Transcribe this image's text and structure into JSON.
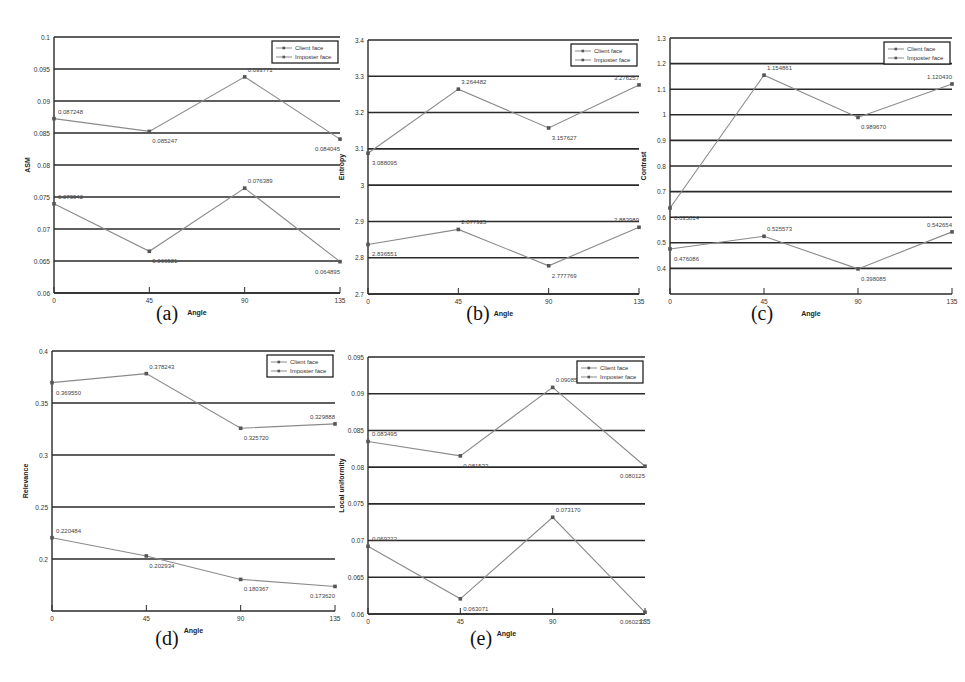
{
  "figure": {
    "captions": [
      "(a)",
      "(b)",
      "(c)",
      "(d)",
      "(e)"
    ]
  },
  "legend": {
    "entries": [
      "Client face",
      "Imposter face"
    ]
  },
  "chart_data": [
    {
      "id": "a",
      "type": "line",
      "caption": "(a)",
      "xlabel": "Angle",
      "ylabel": "ASM",
      "x": [
        0,
        45,
        90,
        135
      ],
      "xticks": [
        "0",
        "45",
        "90",
        "135"
      ],
      "ylim": [
        0.06,
        0.1
      ],
      "yticks": [
        "0.06",
        "0.065",
        "0.07",
        "0.075",
        "0.08",
        "0.085",
        "0.09",
        "0.095",
        "0.1"
      ],
      "grid": true,
      "legend_position": "top-right",
      "series": [
        {
          "name": "Client face",
          "values": [
            0.087248,
            0.085247,
            0.093771,
            0.084045
          ],
          "labels": [
            "0.087248",
            "0.085247",
            "0.093771",
            "0.084045"
          ]
        },
        {
          "name": "Imposter face",
          "values": [
            0.073942,
            0.066521,
            0.076389,
            0.064895
          ],
          "labels": [
            "0.073942",
            "0.066521",
            "0.076389",
            "0.064895"
          ]
        }
      ]
    },
    {
      "id": "b",
      "type": "line",
      "caption": "(b)",
      "xlabel": "Angle",
      "ylabel": "Entropy",
      "x": [
        0,
        45,
        90,
        135
      ],
      "xticks": [
        "0",
        "45",
        "90",
        "135"
      ],
      "ylim": [
        2.7,
        3.4
      ],
      "yticks": [
        "2.7",
        "2.8",
        "2.9",
        "3",
        "3.1",
        "3.2",
        "3.3",
        "3.4"
      ],
      "grid": true,
      "legend_position": "top-right",
      "series": [
        {
          "name": "Client face",
          "values": [
            3.088095,
            3.264482,
            3.157627,
            3.276257
          ],
          "labels": [
            "3.088095",
            "3.264482",
            "3.157627",
            "3.276257"
          ]
        },
        {
          "name": "Imposter face",
          "values": [
            2.836551,
            2.877925,
            2.777769,
            2.883989
          ],
          "labels": [
            "2.836551",
            "2.877925",
            "2.777769",
            "2.883989"
          ]
        }
      ]
    },
    {
      "id": "c",
      "type": "line",
      "caption": "(c)",
      "xlabel": "Angle",
      "ylabel": "Contrast",
      "x": [
        0,
        45,
        90,
        135
      ],
      "xticks": [
        "0",
        "45",
        "90",
        "135"
      ],
      "ylim": [
        0.3,
        1.3
      ],
      "yticks": [
        "0.4",
        "0.5",
        "0.6",
        "0.7",
        "0.8",
        "0.9",
        "1",
        "1.1",
        "1.2",
        "1.3"
      ],
      "grid": true,
      "legend_position": "top-right",
      "series": [
        {
          "name": "Client face",
          "values": [
            0.635814,
            1.154861,
            0.98967,
            1.12043
          ],
          "labels": [
            "0.635814",
            "1.154861",
            "0.989670",
            "1.120430"
          ]
        },
        {
          "name": "Imposter face",
          "values": [
            0.476086,
            0.525573,
            0.398085,
            0.542654
          ],
          "labels": [
            "0.476086",
            "0.525573",
            "0.398085",
            "0.542654"
          ]
        }
      ]
    },
    {
      "id": "d",
      "type": "line",
      "caption": "(d)",
      "xlabel": "Angle",
      "ylabel": "Relevance",
      "x": [
        0,
        45,
        90,
        135
      ],
      "xticks": [
        "0",
        "45",
        "90",
        "135"
      ],
      "ylim": [
        0.15,
        0.4
      ],
      "yticks": [
        "0.2",
        "0.25",
        "0.3",
        "0.35",
        "0.4"
      ],
      "grid": true,
      "legend_position": "top-right",
      "series": [
        {
          "name": "Client face",
          "values": [
            0.36955,
            0.378243,
            0.32572,
            0.329888
          ],
          "labels": [
            "0.369550",
            "0.378243",
            "0.325720",
            "0.329888"
          ]
        },
        {
          "name": "Imposter face",
          "values": [
            0.220484,
            0.202934,
            0.180367,
            0.17362
          ],
          "labels": [
            "0.220484",
            "0.202934",
            "0.180367",
            "0.173620"
          ]
        }
      ]
    },
    {
      "id": "e",
      "type": "line",
      "caption": "(e)",
      "xlabel": "Angle",
      "ylabel": "Local uniformity",
      "x": [
        0,
        45,
        90,
        135
      ],
      "xticks": [
        "0",
        "45",
        "90",
        "135"
      ],
      "ylim": [
        0.06,
        0.095
      ],
      "yticks": [
        "0.06",
        "0.065",
        "0.07",
        "0.075",
        "0.08",
        "0.085",
        "0.09",
        "0.095"
      ],
      "grid": true,
      "legend_position": "top-right",
      "series": [
        {
          "name": "Client face",
          "values": [
            0.083495,
            0.081532,
            0.090859,
            0.080125
          ],
          "labels": [
            "0.083495",
            "0.081532",
            "0.090859",
            "0.080125"
          ]
        },
        {
          "name": "Imposter face",
          "values": [
            0.069222,
            0.062071,
            0.07317,
            0.060237
          ],
          "labels": [
            "0.069222",
            "0.063071",
            "0.073170",
            "0.060237"
          ]
        }
      ]
    }
  ],
  "layout": {
    "panels": [
      {
        "id": "a",
        "left": 54,
        "top": 37,
        "width": 286,
        "height": 256,
        "caption_x": 167,
        "caption_y": 302
      },
      {
        "id": "b",
        "left": 368,
        "top": 40,
        "width": 271,
        "height": 254,
        "caption_x": 478,
        "caption_y": 302
      },
      {
        "id": "c",
        "left": 670,
        "top": 38,
        "width": 282,
        "height": 256,
        "caption_x": 762,
        "caption_y": 302
      },
      {
        "id": "d",
        "left": 52,
        "top": 351,
        "width": 283,
        "height": 260,
        "caption_x": 167,
        "caption_y": 627
      },
      {
        "id": "e",
        "left": 368,
        "top": 357,
        "width": 277,
        "height": 257,
        "caption_x": 481,
        "caption_y": 627
      }
    ],
    "colors": {
      "grid": "#2a2a2a",
      "series_line": "#8a8a8a",
      "marker": "#555555",
      "text": "#333333"
    }
  }
}
